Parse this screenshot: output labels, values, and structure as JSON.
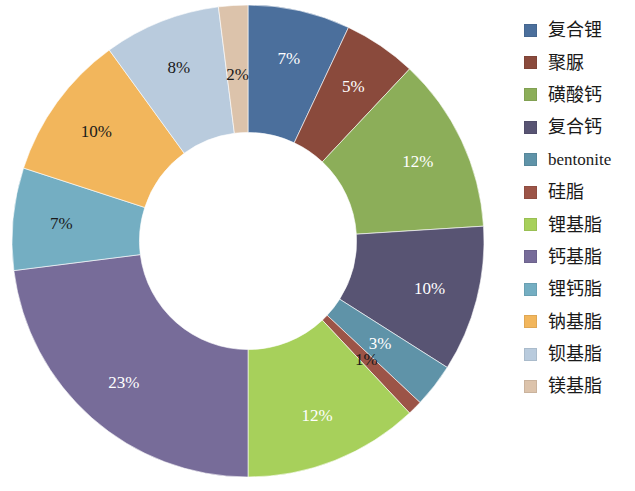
{
  "chart_data": {
    "type": "pie",
    "variant": "donut",
    "title": "",
    "subtitle": "",
    "xlabel": "",
    "ylabel": "",
    "legend_position": "right",
    "grid": false,
    "units": "%",
    "start_angle_deg": 0,
    "direction": "clockwise",
    "inner_radius_ratio": 0.46,
    "categories": [
      "复合锂",
      "聚脲",
      "磺酸钙",
      "复合钙",
      "bentonite",
      "硅脂",
      "锂基脂",
      "钙基脂",
      "锂钙脂",
      "钠基脂",
      "钡基脂",
      "镁基脂"
    ],
    "values": [
      7,
      5,
      12,
      10,
      3,
      1,
      12,
      23,
      7,
      10,
      8,
      2
    ],
    "labels": [
      "7%",
      "5%",
      "12%",
      "10%",
      "3%",
      "1%",
      "12%",
      "23%",
      "7%",
      "10%",
      "8%",
      "2%"
    ],
    "colors": [
      "#4b6f9c",
      "#8a4a3c",
      "#8cae59",
      "#585473",
      "#5f93a8",
      "#9c5447",
      "#a7d05b",
      "#776c99",
      "#74aec2",
      "#f2b65c",
      "#b9cbdd",
      "#dcc3ab"
    ],
    "label_colors": [
      "#ffffff",
      "#ffffff",
      "#ffffff",
      "#ffffff",
      "#ffffff",
      "#1a1a1a",
      "#ffffff",
      "#ffffff",
      "#1a1a1a",
      "#1a1a1a",
      "#1a1a1a",
      "#1a1a1a"
    ],
    "total": 100
  },
  "legend": {
    "items": [
      {
        "label": "复合锂",
        "color": "#4b6f9c",
        "value": 7
      },
      {
        "label": "聚脲",
        "color": "#8a4a3c",
        "value": 5
      },
      {
        "label": "磺酸钙",
        "color": "#8cae59",
        "value": 12
      },
      {
        "label": "复合钙",
        "color": "#585473",
        "value": 10
      },
      {
        "label": "bentonite",
        "color": "#5f93a8",
        "value": 3
      },
      {
        "label": "硅脂",
        "color": "#9c5447",
        "value": 1
      },
      {
        "label": "锂基脂",
        "color": "#a7d05b",
        "value": 12
      },
      {
        "label": "钙基脂",
        "color": "#776c99",
        "value": 23
      },
      {
        "label": "锂钙脂",
        "color": "#74aec2",
        "value": 7
      },
      {
        "label": "钠基脂",
        "color": "#f2b65c",
        "value": 10
      },
      {
        "label": "钡基脂",
        "color": "#b9cbdd",
        "value": 8
      },
      {
        "label": "镁基脂",
        "color": "#dcc3ab",
        "value": 2
      }
    ]
  }
}
